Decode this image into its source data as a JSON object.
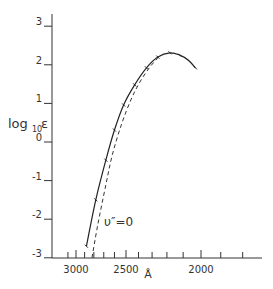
{
  "chart_data": {
    "type": "line",
    "title": "",
    "xlabel": "Å",
    "ylabel": "log₁₀ε",
    "ylabel_parts": {
      "main": "log",
      "sub": "10",
      "sym": "ε"
    },
    "ylim": [
      -3,
      3
    ],
    "x_scale": "wavenumber (1/λ), reversed wavelength axis",
    "x_ticks_labeled": [
      3000,
      2500,
      2000
    ],
    "y_ticks": [
      3,
      2,
      1,
      0,
      -1,
      -2,
      -3
    ],
    "grid": false,
    "legend": null,
    "annotations": [
      {
        "text": "υ″=0",
        "near_series": "dashed",
        "x": 2620,
        "y": -2.0
      }
    ],
    "series": [
      {
        "name": "observed",
        "style": "solid",
        "points": [
          {
            "x": 2880,
            "y": -2.7
          },
          {
            "x": 2780,
            "y": -1.5
          },
          {
            "x": 2680,
            "y": -0.47
          },
          {
            "x": 2600,
            "y": 0.31
          },
          {
            "x": 2520,
            "y": 0.96
          },
          {
            "x": 2430,
            "y": 1.48
          },
          {
            "x": 2340,
            "y": 1.92
          },
          {
            "x": 2260,
            "y": 2.2
          },
          {
            "x": 2180,
            "y": 2.31
          },
          {
            "x": 2120,
            "y": 2.25
          },
          {
            "x": 2070,
            "y": 2.12
          },
          {
            "x": 2030,
            "y": 1.92
          }
        ]
      },
      {
        "name": "υ″=0",
        "style": "dashed",
        "points": [
          {
            "x": 2820,
            "y": -3.0
          },
          {
            "x": 2760,
            "y": -2.15
          },
          {
            "x": 2680,
            "y": -1.11
          },
          {
            "x": 2620,
            "y": -0.34
          },
          {
            "x": 2540,
            "y": 0.44
          },
          {
            "x": 2460,
            "y": 1.09
          },
          {
            "x": 2390,
            "y": 1.55
          },
          {
            "x": 2320,
            "y": 1.92
          },
          {
            "x": 2260,
            "y": 2.18
          }
        ]
      }
    ]
  },
  "labels": {
    "y_ticks": [
      "3",
      "2",
      "1",
      "0",
      "-1",
      "-2",
      "-3"
    ],
    "x_ticks": [
      "3000",
      "2500",
      "2000"
    ],
    "x_unit": "Å",
    "annotation": "υ″=0"
  }
}
